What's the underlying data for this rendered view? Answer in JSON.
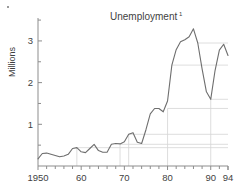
{
  "chart_data": {
    "type": "line",
    "title": "Unemployment",
    "title_superscript": "1",
    "xlabel": "",
    "ylabel": "Millions",
    "xlim": [
      1950,
      1994
    ],
    "ylim": [
      0,
      3.55
    ],
    "yticks": [
      1,
      2,
      3
    ],
    "ytick_labels": [
      "1",
      "2",
      "3"
    ],
    "yminor_step": 0.5,
    "xticks": [
      1950,
      1960,
      1970,
      1980,
      1990,
      1994
    ],
    "xtick_labels": [
      "1950",
      "60",
      "70",
      "80",
      "90",
      "94"
    ],
    "xminor_step": 2,
    "grid": "horizontal reference lines from local extrema, rightward only",
    "legend": "none",
    "line_color": "#6e6e6e",
    "grid_color": "#d6d6d6",
    "axis_color": "#8d8d8d",
    "series": [
      {
        "name": "Unemployment",
        "units": "Millions",
        "x": [
          1950,
          1951,
          1952,
          1953,
          1954,
          1955,
          1956,
          1957,
          1958,
          1959,
          1960,
          1961,
          1962,
          1963,
          1964,
          1965,
          1966,
          1967,
          1968,
          1969,
          1970,
          1971,
          1972,
          1973,
          1974,
          1975,
          1976,
          1977,
          1978,
          1979,
          1980,
          1981,
          1982,
          1983,
          1984,
          1985,
          1986,
          1987,
          1988,
          1989,
          1990,
          1991,
          1992,
          1993,
          1994
        ],
        "values": [
          0.17,
          0.3,
          0.31,
          0.28,
          0.25,
          0.22,
          0.24,
          0.28,
          0.42,
          0.44,
          0.34,
          0.32,
          0.42,
          0.52,
          0.37,
          0.33,
          0.33,
          0.52,
          0.54,
          0.53,
          0.58,
          0.76,
          0.8,
          0.57,
          0.54,
          0.87,
          1.25,
          1.38,
          1.38,
          1.3,
          1.56,
          2.42,
          2.79,
          2.98,
          3.03,
          3.1,
          3.29,
          2.95,
          2.33,
          1.78,
          1.6,
          2.29,
          2.78,
          2.92,
          2.65
        ]
      }
    ],
    "reference_lines": [
      {
        "y": 0.44,
        "from_x": 1959,
        "to_x": 1994
      },
      {
        "y": 0.52,
        "from_x": 1969,
        "to_x": 1994
      },
      {
        "y": 0.76,
        "from_x": 1971,
        "to_x": 1994
      },
      {
        "y": 1.38,
        "from_x": 1980,
        "to_x": 1994
      },
      {
        "y": 1.6,
        "from_x": 1990,
        "to_x": 1994
      },
      {
        "y": 2.42,
        "from_x": 1981,
        "to_x": 1994
      },
      {
        "y": 2.95,
        "from_x": 1987,
        "to_x": 1994
      }
    ],
    "drop_lines": [
      {
        "x": 1959,
        "y": 0.44
      },
      {
        "x": 1969,
        "y": 0.52
      },
      {
        "x": 1971,
        "y": 0.76
      },
      {
        "x": 1980,
        "y": 1.38
      },
      {
        "x": 1990,
        "y": 1.6
      }
    ]
  }
}
